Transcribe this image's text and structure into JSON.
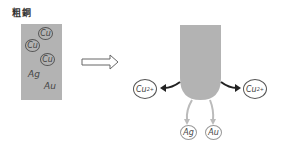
{
  "title": "粗銅",
  "crude_copper": {
    "ions": [
      "Cu",
      "Cu",
      "Cu"
    ],
    "metals": [
      "Ag",
      "Au"
    ],
    "color": "#b3b3b3"
  },
  "electrode": {
    "color": "#b3b3b3",
    "released_ions": [
      {
        "label": "Cu",
        "charge": "2+"
      },
      {
        "label": "Cu",
        "charge": "2+"
      }
    ],
    "sludge": [
      "Ag",
      "Au"
    ]
  },
  "arrow": {
    "direction": "right"
  }
}
